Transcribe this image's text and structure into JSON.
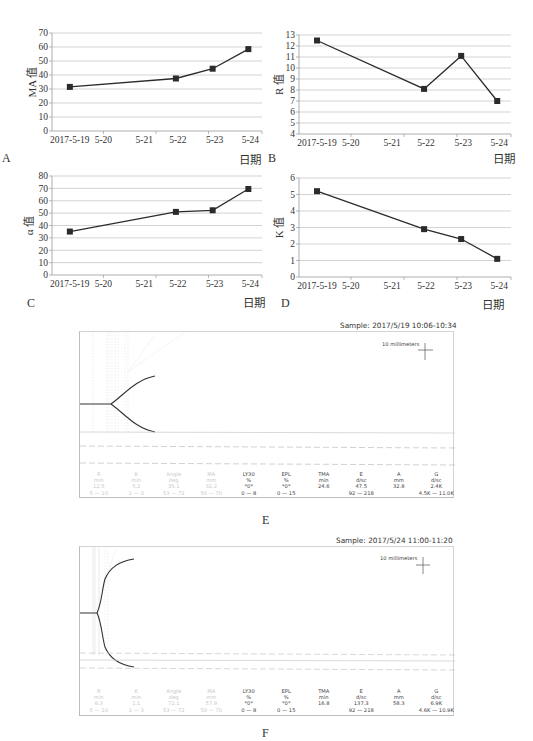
{
  "chart_data": [
    {
      "panel": "A",
      "type": "line",
      "title": "",
      "xlabel": "日期",
      "ylabel": "MA 值",
      "categories": [
        "2017-5-19",
        "5-20",
        "5-21",
        "5-22",
        "5-23",
        "5-24"
      ],
      "x": [
        "2017-5-19",
        "5-22",
        "5-23",
        "5-24"
      ],
      "values": [
        31.5,
        37.5,
        44.5,
        58.5
      ],
      "ylim": [
        0,
        70
      ],
      "yticks": [
        0,
        10,
        20,
        30,
        40,
        50,
        60,
        70
      ],
      "grid": true,
      "marker": "square"
    },
    {
      "panel": "B",
      "type": "line",
      "title": "",
      "xlabel": "日期",
      "ylabel": "R 值",
      "categories": [
        "2017-5-19",
        "5-20",
        "5-21",
        "5-22",
        "5-23",
        "5-24"
      ],
      "x": [
        "2017-5-19",
        "5-22",
        "5-23",
        "5-24"
      ],
      "values": [
        12.5,
        8.1,
        11.1,
        7.0
      ],
      "ylim": [
        4,
        13
      ],
      "yticks": [
        4,
        5,
        6,
        7,
        8,
        9,
        10,
        11,
        12,
        13
      ],
      "grid": true,
      "marker": "square"
    },
    {
      "panel": "C",
      "type": "line",
      "title": "",
      "xlabel": "日期",
      "ylabel": "α 值",
      "categories": [
        "2017-5-19",
        "5-20",
        "5-21",
        "5-22",
        "5-23",
        "5-24"
      ],
      "x": [
        "2017-5-19",
        "5-22",
        "5-23",
        "5-24"
      ],
      "values": [
        35.1,
        51.0,
        52.3,
        69.5
      ],
      "ylim": [
        0,
        80
      ],
      "yticks": [
        0,
        10,
        20,
        30,
        40,
        50,
        60,
        70,
        80
      ],
      "grid": true,
      "marker": "square"
    },
    {
      "panel": "D",
      "type": "line",
      "title": "",
      "xlabel": "日期",
      "ylabel": "K 值",
      "categories": [
        "2017-5-19",
        "5-20",
        "5-21",
        "5-22",
        "5-23",
        "5-24"
      ],
      "x": [
        "2017-5-19",
        "5-22",
        "5-23",
        "5-24"
      ],
      "values": [
        5.2,
        2.9,
        2.3,
        1.1
      ],
      "ylim": [
        0,
        6
      ],
      "yticks": [
        0,
        1,
        2,
        3,
        4,
        5,
        6
      ],
      "grid": true,
      "marker": "square"
    },
    {
      "panel": "E",
      "type": "table",
      "sample": "Sample: 2017/5/19 10:06-10:34",
      "scale_label": "10 millimeters",
      "parameters": [
        {
          "name": "R",
          "unit": "min",
          "value": "12.5",
          "range": "5 — 10",
          "faded": true
        },
        {
          "name": "K",
          "unit": "min",
          "value": "5.2",
          "range": "1 — 3",
          "faded": true
        },
        {
          "name": "Angle",
          "unit": "deg",
          "value": "35.1",
          "range": "53 — 72",
          "faded": true
        },
        {
          "name": "MA",
          "unit": "mm",
          "value": "32.2",
          "range": "50 — 70",
          "faded": true
        },
        {
          "name": "LY30",
          "unit": "%",
          "value": "*0*",
          "range": "0 — 8",
          "faded": false
        },
        {
          "name": "EPL",
          "unit": "%",
          "value": "*0*",
          "range": "0 — 15",
          "faded": false
        },
        {
          "name": "TMA",
          "unit": "min",
          "value": "24.6",
          "range": "",
          "faded": false
        },
        {
          "name": "E",
          "unit": "d/sc",
          "value": "47.5",
          "range": "92 — 218",
          "faded": false
        },
        {
          "name": "A",
          "unit": "mm",
          "value": "32.8",
          "range": "",
          "faded": false
        },
        {
          "name": "G",
          "unit": "d/sc",
          "value": "2.4K",
          "range": "4.5K — 11.0K",
          "faded": false
        }
      ]
    },
    {
      "panel": "F",
      "type": "table",
      "sample": "Sample: 2017/5/24 11:00-11:20",
      "scale_label": "10 millimeters",
      "parameters": [
        {
          "name": "R",
          "unit": "min",
          "value": "6.3",
          "range": "5 — 10",
          "faded": true
        },
        {
          "name": "K",
          "unit": "min",
          "value": "1.1",
          "range": "1 — 3",
          "faded": true
        },
        {
          "name": "Angle",
          "unit": "deg",
          "value": "72.1",
          "range": "53 — 72",
          "faded": true
        },
        {
          "name": "MA",
          "unit": "mm",
          "value": "57.9",
          "range": "50 — 70",
          "faded": true
        },
        {
          "name": "LY30",
          "unit": "%",
          "value": "*0*",
          "range": "0 — 8",
          "faded": false
        },
        {
          "name": "EPL",
          "unit": "%",
          "value": "*0*",
          "range": "0 — 15",
          "faded": false
        },
        {
          "name": "TMA",
          "unit": "min",
          "value": "16.8",
          "range": "",
          "faded": false
        },
        {
          "name": "E",
          "unit": "d/sc",
          "value": "137.3",
          "range": "92 — 218",
          "faded": false
        },
        {
          "name": "A",
          "unit": "mm",
          "value": "58.3",
          "range": "",
          "faded": false
        },
        {
          "name": "G",
          "unit": "d/sc",
          "value": "6.9K",
          "range": "4.6K — 10.9K",
          "faded": false
        }
      ]
    }
  ],
  "panels": {
    "A": {
      "letter": "A",
      "xname": "日期"
    },
    "B": {
      "letter": "B",
      "xname": "日期"
    },
    "C": {
      "letter": "C",
      "xname": "日期"
    },
    "D": {
      "letter": "D",
      "xname": "日期"
    },
    "E": {
      "letter": "E",
      "sample": "Sample: 2017/5/19 10:06-10:34",
      "scale_label": "10 millimeters"
    },
    "F": {
      "letter": "F",
      "sample": "Sample: 2017/5/24 11:00-11:20",
      "scale_label": "10 millimeters"
    }
  },
  "style": {
    "line_color": "#2b2b2b",
    "grid_color": "#c8c8c8",
    "axis_color": "#9a9a9a",
    "faded_text": "#c9c9c9"
  }
}
